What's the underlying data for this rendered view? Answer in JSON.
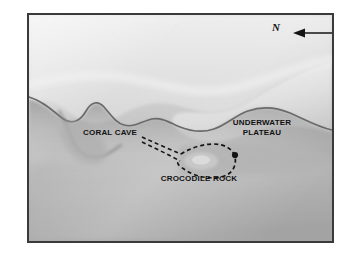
{
  "figure": {
    "type": "bathymetric-shaded-relief-map",
    "frame_color": "#3a3a3a",
    "page_background": "#ffffff"
  },
  "compass": {
    "label": "N",
    "icon": "arrow-left-icon",
    "direction": "left"
  },
  "labels": {
    "underwater_plateau": "UNDERWATER\nPLATEAU",
    "coral_cave": "CORAL CAVE",
    "crocodile_rock": "CROCODILE ROCK"
  },
  "annotations": {
    "dashed_outline_color": "#111111",
    "point_marker_color": "#111111",
    "leader_line_style": "dashed-double"
  },
  "terrain": {
    "palette": {
      "highland_light": "#e9e9e9",
      "plateau_mid": "#cfcfcf",
      "slope_gray": "#b5b5b5",
      "basin_gray": "#a8a8a8",
      "scarp_dark": "#6e6e6e"
    }
  }
}
